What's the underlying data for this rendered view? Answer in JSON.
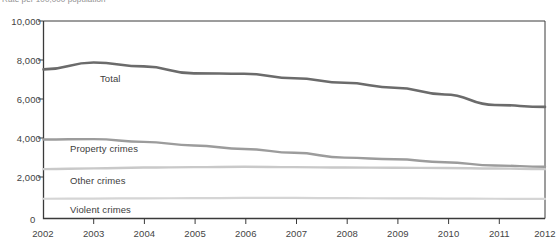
{
  "header": {
    "clipped_note": "Rate per 100,000 population"
  },
  "axes": {
    "y_ticks": [
      "0",
      "2,000",
      "4,000",
      "6,000",
      "8,000",
      "10,000"
    ],
    "y_origin_label": "0",
    "x_ticks": [
      "2002",
      "2003",
      "2004",
      "2005",
      "2006",
      "2007",
      "2008",
      "2009",
      "2010",
      "2011",
      "2012"
    ]
  },
  "series_labels": {
    "total": "Total",
    "property": "Property crimes",
    "other": "Other crimes",
    "violent": "Violent crimes"
  },
  "colors": {
    "total_line": "#6b6b6b",
    "property_line": "#9c9c9c",
    "other_line": "#c9c9c9",
    "violent_line": "#d5d5d5",
    "axis": "#3a3a3a",
    "text": "#444444",
    "background": "#ffffff"
  },
  "chart_data": {
    "type": "line",
    "title": "",
    "subtitle": "",
    "xlabel": "",
    "ylabel": "Rate per 100,000 population",
    "categories": [
      "2002",
      "2003",
      "2004",
      "2005",
      "2006",
      "2007",
      "2008",
      "2009",
      "2010",
      "2011",
      "2012"
    ],
    "x": [
      2002,
      2003,
      2004,
      2005,
      2006,
      2007,
      2008,
      2009,
      2010,
      2011,
      2012
    ],
    "ylim": [
      0,
      10000
    ],
    "xlim": [
      2002,
      2012
    ],
    "grid": false,
    "legend": "inline-labels",
    "y_tick_values": [
      0,
      2000,
      4000,
      6000,
      8000,
      10000
    ],
    "series": [
      {
        "name": "Total",
        "color": "#6b6b6b",
        "values": [
          7550,
          7900,
          7700,
          7350,
          7330,
          7100,
          6870,
          6620,
          6280,
          5750,
          5650
        ]
      },
      {
        "name": "Property crimes",
        "color": "#9c9c9c",
        "values": [
          4000,
          4020,
          3880,
          3700,
          3520,
          3330,
          3080,
          3000,
          2850,
          2680,
          2620
        ]
      },
      {
        "name": "Other crimes",
        "color": "#c9c9c9",
        "values": [
          2500,
          2540,
          2580,
          2600,
          2620,
          2600,
          2580,
          2570,
          2560,
          2530,
          2500
        ]
      },
      {
        "name": "Violent crimes",
        "color": "#d5d5d5",
        "values": [
          1000,
          1010,
          1020,
          1030,
          1040,
          1040,
          1030,
          1020,
          1010,
          1000,
          990
        ]
      }
    ]
  }
}
